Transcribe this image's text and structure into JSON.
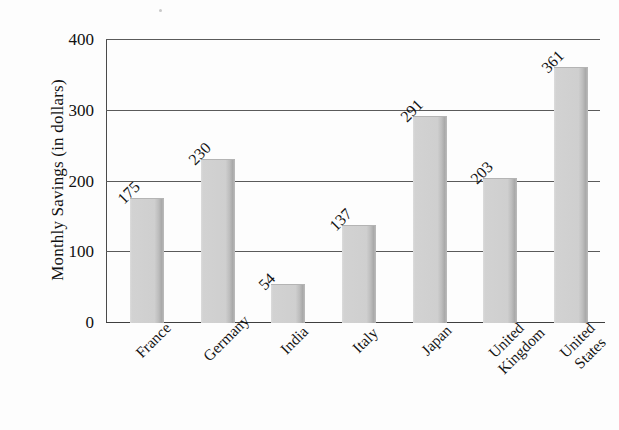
{
  "chart_data": {
    "type": "bar",
    "title": "",
    "xlabel": "",
    "ylabel": "Monthly Savings (in dollars)",
    "categories": [
      "France",
      "Germany",
      "India",
      "Italy",
      "Japan",
      "United Kingdom",
      "United States"
    ],
    "category_lines": [
      [
        "France"
      ],
      [
        "Germany"
      ],
      [
        "India"
      ],
      [
        "Italy"
      ],
      [
        "Japan"
      ],
      [
        "United",
        "Kingdom"
      ],
      [
        "United",
        "States"
      ]
    ],
    "values": [
      175,
      230,
      54,
      137,
      291,
      203,
      361
    ],
    "value_labels": [
      "175",
      "230",
      "54",
      "137",
      "291",
      "203",
      "361"
    ],
    "ylim": [
      0,
      400
    ],
    "yticks": [
      0,
      100,
      200,
      300,
      400
    ],
    "ytick_labels": [
      "0",
      "100",
      "200",
      "300",
      "400"
    ],
    "grid": true,
    "grid_axis": "y",
    "legend": false,
    "bar_color": "#d2d2d2",
    "bar_edge_color": "#a9a9a9",
    "axis_color": "#4a4a4a",
    "text_color": "#141414",
    "background": "#fdfdfd",
    "label_rotation_deg": 45
  }
}
